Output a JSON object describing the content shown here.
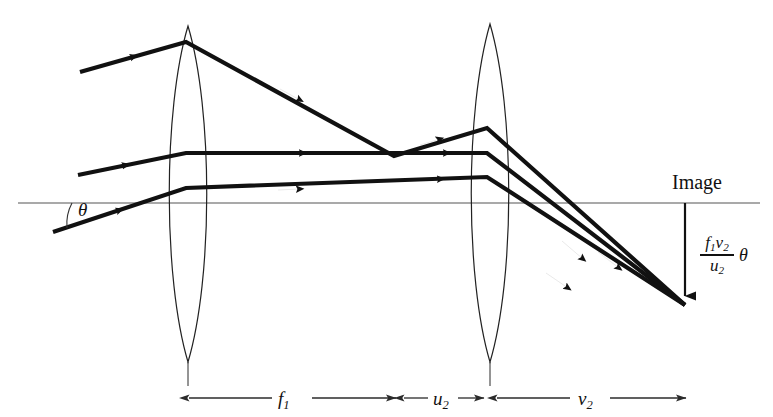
{
  "figure": {
    "width": 773,
    "height": 417,
    "background": "#ffffff",
    "ink_color": "#111111",
    "axis_color": "#555555"
  },
  "labels": {
    "image": "Image",
    "angle_theta": "θ",
    "formula": {
      "numerator_f": "f",
      "numerator_f_sub": "1",
      "numerator_v": "v",
      "numerator_v_sub": "2",
      "denominator_u": "u",
      "denominator_u_sub": "2",
      "theta": "θ"
    }
  },
  "dimensions": [
    {
      "name": "focal-length-1",
      "symbol": "f",
      "subscript": "1",
      "x_start": 188,
      "x_end": 397,
      "y": 398
    },
    {
      "name": "object-distance-2",
      "symbol": "u",
      "subscript": "2",
      "x_start": 403,
      "x_end": 484,
      "y": 398
    },
    {
      "name": "image-distance-2",
      "symbol": "v",
      "subscript": "2",
      "x_start": 496,
      "x_end": 686,
      "y": 398
    }
  ],
  "optics": {
    "axis": {
      "y": 203,
      "x_start": 18,
      "x_end": 760
    },
    "lenses": [
      {
        "name": "lens-1",
        "cx": 188,
        "top_y": 26,
        "bottom_y": 362,
        "half_width": 26
      },
      {
        "name": "lens-2",
        "cx": 490,
        "top_y": 24,
        "bottom_y": 362,
        "half_width": 26
      }
    ],
    "image_point": {
      "x": 685,
      "y": 305
    },
    "image_marker": {
      "x": 685,
      "y_start": 203,
      "y_end": 302
    },
    "crossing_point": {
      "x": 394,
      "y": 156
    },
    "rays": [
      {
        "name": "ray-top",
        "points": [
          [
            80,
            72
          ],
          [
            186,
            42
          ],
          [
            394,
            156
          ],
          [
            487,
            128
          ],
          [
            685,
            305
          ]
        ],
        "arrows": [
          [
            132,
            57
          ],
          [
            297,
            98
          ],
          [
            436,
            141
          ],
          [
            580,
            255
          ]
        ]
      },
      {
        "name": "ray-middle",
        "points": [
          [
            78,
            175
          ],
          [
            186,
            153
          ],
          [
            487,
            153
          ],
          [
            685,
            305
          ]
        ],
        "arrows": [
          [
            123,
            166
          ],
          [
            300,
            153
          ],
          [
            443,
            154
          ],
          [
            615,
            264
          ]
        ]
      },
      {
        "name": "ray-bottom",
        "points": [
          [
            53,
            232
          ],
          [
            186,
            188
          ],
          [
            487,
            177
          ],
          [
            685,
            305
          ]
        ],
        "arrows": [
          [
            117,
            211
          ],
          [
            297,
            189
          ],
          [
            437,
            178
          ],
          [
            565,
            285
          ]
        ]
      }
    ],
    "angle_arc": {
      "cx": 110,
      "cy": 203,
      "radius": 42,
      "start_deg": 0,
      "end_deg": 19
    }
  }
}
